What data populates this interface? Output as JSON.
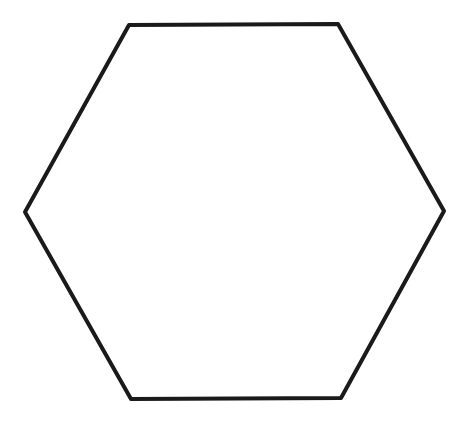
{
  "diagram": {
    "shape": "hexagon",
    "stroke_color": "#1a1a1a",
    "fill_color": "#ffffff",
    "stroke_width": 4,
    "vertices": [
      {
        "x": 129,
        "y": 25
      },
      {
        "x": 338,
        "y": 24
      },
      {
        "x": 444,
        "y": 211
      },
      {
        "x": 341,
        "y": 398
      },
      {
        "x": 131,
        "y": 399
      },
      {
        "x": 25,
        "y": 212
      }
    ]
  }
}
